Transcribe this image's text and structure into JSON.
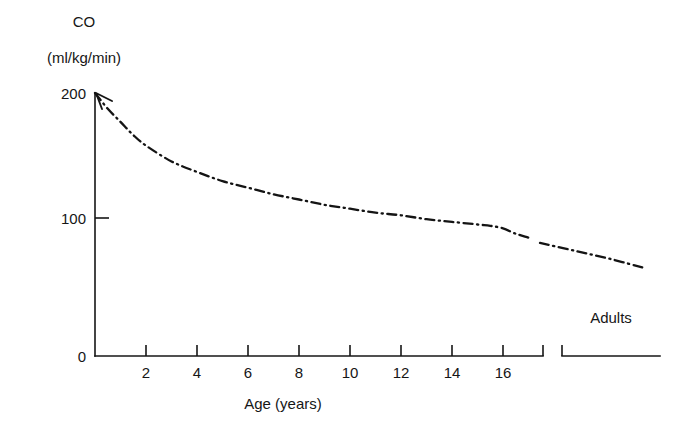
{
  "figure": {
    "background_color": "#ffffff",
    "ink_color": "#161616"
  },
  "chart_data": {
    "type": "line",
    "title": "",
    "ylabel": "CO",
    "yunits": "(ml/kg/min)",
    "xlabel": "Age (years)",
    "ylim": [
      0,
      200
    ],
    "xlim": [
      0,
      17
    ],
    "grid": false,
    "legend": null,
    "line_style": "dash-dot",
    "y_ticks": [
      "0",
      "100",
      "200"
    ],
    "y_tick_values": [
      0,
      100,
      200
    ],
    "x_ticks": [
      "2",
      "4",
      "6",
      "8",
      "10",
      "12",
      "14",
      "16"
    ],
    "x_tick_values": [
      2,
      4,
      6,
      8,
      10,
      12,
      14,
      16
    ],
    "axis_break": true,
    "break_group_label": "Adults",
    "series": [
      {
        "name": "Cardiac output",
        "x": [
          0,
          0.5,
          1,
          1.5,
          2,
          3,
          4,
          5,
          6,
          7,
          8,
          9,
          10,
          11,
          12,
          13,
          14,
          15,
          15.5,
          16,
          16.5,
          17
        ],
        "values": [
          200,
          188,
          178,
          168,
          160,
          148,
          140,
          133,
          128,
          123,
          119,
          115,
          112,
          109,
          107,
          104,
          102,
          100,
          99,
          97,
          93,
          90
        ]
      },
      {
        "name": "Cardiac output (adults)",
        "x_group": "Adults",
        "x": [
          17.6,
          18.4,
          19.2,
          20.0
        ],
        "values": [
          86,
          80,
          74,
          67
        ]
      }
    ],
    "annotations": [
      {
        "text": "Adults",
        "kind": "group-label"
      },
      {
        "text": "arrowhead",
        "kind": "curve-start-marker"
      }
    ]
  }
}
